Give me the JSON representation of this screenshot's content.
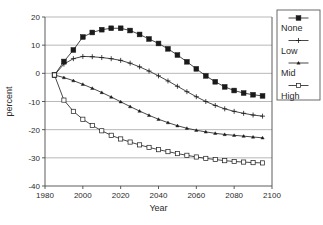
{
  "chart_data": {
    "type": "line",
    "title": "",
    "xlabel": "Year",
    "ylabel": "percent",
    "xlim": [
      1980,
      2100
    ],
    "ylim": [
      -40,
      20
    ],
    "xticks": [
      1980,
      2000,
      2020,
      2040,
      2060,
      2080,
      2100
    ],
    "yticks": [
      20,
      10,
      0,
      -10,
      -20,
      -30,
      -40
    ],
    "xtick_labels": [
      "1980",
      "2000",
      "2020",
      "2040",
      "2060",
      "2080",
      "2100"
    ],
    "ytick_labels": [
      "20",
      "10",
      "0",
      "-10",
      "-20",
      "-30",
      "-40"
    ],
    "grid": true,
    "grid_axis": "y",
    "legend_position": "right-outside",
    "x": [
      1985,
      1990,
      1995,
      2000,
      2005,
      2010,
      2015,
      2020,
      2025,
      2030,
      2035,
      2040,
      2045,
      2050,
      2055,
      2060,
      2065,
      2070,
      2075,
      2080,
      2085,
      2090,
      2095
    ],
    "series": [
      {
        "name": "None",
        "marker": "filled-square",
        "values": [
          -0.6,
          4.2,
          8.3,
          12.9,
          14.5,
          15.5,
          16.0,
          16.0,
          15.2,
          13.8,
          12.2,
          10.6,
          8.7,
          6.5,
          4.1,
          1.6,
          -0.9,
          -3.0,
          -4.8,
          -6.1,
          -7.0,
          -7.6,
          -8.0
        ]
      },
      {
        "name": "Low",
        "marker": "plus",
        "values": [
          -0.6,
          3.3,
          5.2,
          6.0,
          5.9,
          5.6,
          5.2,
          4.6,
          3.6,
          2.3,
          0.8,
          -0.9,
          -2.7,
          -4.6,
          -6.5,
          -8.3,
          -10.0,
          -11.4,
          -12.6,
          -13.5,
          -14.2,
          -14.8,
          -15.2
        ]
      },
      {
        "name": "Mid",
        "marker": "small-triangle",
        "values": [
          -0.6,
          -1.5,
          -2.6,
          -3.9,
          -5.3,
          -6.8,
          -8.4,
          -10.1,
          -11.8,
          -13.4,
          -14.9,
          -16.3,
          -17.5,
          -18.6,
          -19.5,
          -20.2,
          -20.8,
          -21.3,
          -21.7,
          -22.0,
          -22.3,
          -22.6,
          -22.9
        ]
      },
      {
        "name": "High",
        "marker": "open-square",
        "values": [
          -0.6,
          -9.5,
          -13.5,
          -16.3,
          -18.5,
          -20.4,
          -22.0,
          -23.3,
          -24.4,
          -25.4,
          -26.3,
          -27.1,
          -27.8,
          -28.5,
          -29.1,
          -29.7,
          -30.2,
          -30.6,
          -31.0,
          -31.3,
          -31.5,
          -31.7,
          -31.8
        ]
      }
    ]
  },
  "legend": {
    "entries": [
      {
        "label": "None",
        "marker": "filled-square"
      },
      {
        "label": "Low",
        "marker": "plus"
      },
      {
        "label": "Mid",
        "marker": "small-triangle"
      },
      {
        "label": "High",
        "marker": "open-square"
      }
    ]
  },
  "colors": {
    "line": "#1a1a1a",
    "grid": "#9a9a9a",
    "frame": "#4a4a4a",
    "text": "#2b2b2b",
    "background": "#ffffff"
  }
}
